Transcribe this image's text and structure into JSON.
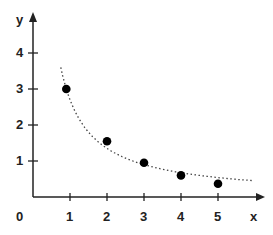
{
  "chart_data": {
    "type": "scatter",
    "title": "",
    "xlabel": "x",
    "ylabel": "y",
    "origin_label": "0",
    "x_ticks": [
      "1",
      "2",
      "3",
      "4",
      "5"
    ],
    "y_ticks": [
      "1",
      "2",
      "3",
      "4"
    ],
    "xlim": [
      0,
      5.9
    ],
    "ylim": [
      0,
      5.0
    ],
    "grid": false,
    "legend": null,
    "series": [
      {
        "name": "points",
        "style": "filled-circle",
        "x": [
          0.9,
          2,
          3,
          4,
          5
        ],
        "y": [
          3.0,
          1.55,
          0.95,
          0.6,
          0.37
        ]
      },
      {
        "name": "fitted curve",
        "style": "dotted-line",
        "function": "y = 2.7 / x (approx. inverse decay)",
        "x_range": [
          0.4,
          5.9
        ]
      }
    ]
  },
  "colors": {
    "axis": "#222222",
    "points": "#000000",
    "curve": "#444444"
  }
}
